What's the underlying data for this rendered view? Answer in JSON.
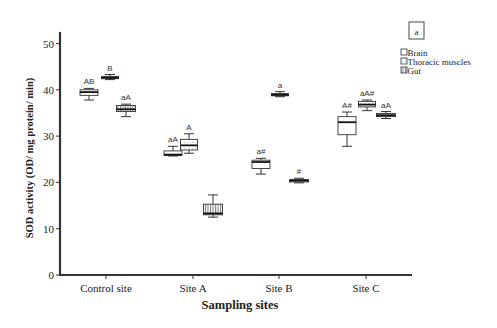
{
  "chart_data": {
    "type": "box",
    "title": "",
    "panel_label": "a",
    "xlabel": "Sampling sites",
    "ylabel": "SOD activity (OD/ mg protein/ min)",
    "ylim": [
      0,
      52
    ],
    "yticks": [
      0,
      10,
      20,
      30,
      40,
      50
    ],
    "categories": [
      "Control site",
      "Site A",
      "Site B",
      "Site C"
    ],
    "legend": {
      "position": "upper right",
      "entries": [
        "Brain",
        "Thoracic muscles",
        "Gut"
      ]
    },
    "series": [
      {
        "name": "Brain",
        "pattern": "plain",
        "boxes": [
          {
            "min": 37.8,
            "q1": 38.8,
            "median": 39.5,
            "q3": 40.0,
            "max": 40.3,
            "label": "AB"
          },
          {
            "min": 25.7,
            "q1": 25.8,
            "median": 26.0,
            "q3": 26.8,
            "max": 27.8,
            "label": "aA"
          },
          {
            "min": 21.8,
            "q1": 23.0,
            "median": 24.4,
            "q3": 24.8,
            "max": 25.2,
            "label": "a#"
          },
          {
            "min": 27.8,
            "q1": 30.3,
            "median": 33.0,
            "q3": 34.2,
            "max": 35.2,
            "label": "A#"
          }
        ]
      },
      {
        "name": "Thoracic muscles",
        "pattern": "dotted",
        "boxes": [
          {
            "min": 42.2,
            "q1": 42.4,
            "median": 42.6,
            "q3": 42.9,
            "max": 43.3,
            "label": "B"
          },
          {
            "min": 26.3,
            "q1": 27.0,
            "median": 28.0,
            "q3": 29.3,
            "max": 30.5,
            "label": "A"
          },
          {
            "min": 38.5,
            "q1": 38.7,
            "median": 38.9,
            "q3": 39.2,
            "max": 39.6,
            "label": "a"
          },
          {
            "min": 35.5,
            "q1": 36.3,
            "median": 36.8,
            "q3": 37.5,
            "max": 37.8,
            "label": "aA#"
          }
        ]
      },
      {
        "name": "Gut",
        "pattern": "vertical-lines",
        "boxes": [
          {
            "min": 34.2,
            "q1": 35.3,
            "median": 35.8,
            "q3": 36.6,
            "max": 36.9,
            "label": "aA"
          },
          {
            "min": 12.5,
            "q1": 13.0,
            "median": 13.3,
            "q3": 15.3,
            "max": 17.3,
            "label": ""
          },
          {
            "min": 19.9,
            "q1": 20.1,
            "median": 20.4,
            "q3": 20.6,
            "max": 20.9,
            "label": "#"
          },
          {
            "min": 33.8,
            "q1": 34.2,
            "median": 34.5,
            "q3": 34.9,
            "max": 35.3,
            "label": "aA"
          }
        ]
      }
    ],
    "grid": false
  }
}
